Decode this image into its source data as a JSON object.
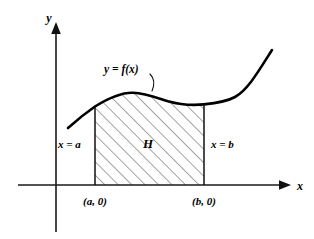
{
  "figure": {
    "title_alt": "Region H bounded by y = f(x), x = a, x = b and the x-axis",
    "background_color": "#ffffff",
    "ink_color": "#000000"
  },
  "axes": {
    "x_label": "x",
    "y_label": "y",
    "x_arrow_icon": "arrow-right-icon",
    "y_arrow_icon": "arrow-up-icon"
  },
  "curve": {
    "label": "y = f(x)",
    "stroke_color": "#000000"
  },
  "region": {
    "label": "H",
    "fill_pattern": "diagonal-hatch",
    "hatch_color": "#2b2b2b"
  },
  "boundaries": {
    "left_label": "x = a",
    "right_label": "x = b"
  },
  "points": {
    "left_point_label": "(a, 0)",
    "right_point_label": "(b, 0)"
  }
}
